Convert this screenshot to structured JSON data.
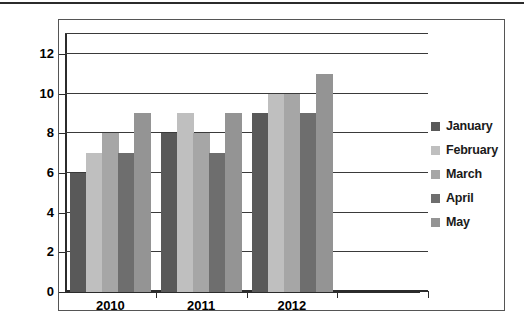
{
  "chart_data": {
    "type": "bar",
    "title": "",
    "xlabel": "",
    "ylabel": "",
    "categories": [
      "2010",
      "2011",
      "2012",
      ""
    ],
    "series": [
      {
        "name": "January",
        "color": "#595959",
        "values": [
          6,
          8,
          9,
          null
        ]
      },
      {
        "name": "February",
        "color": "#bfbfbf",
        "values": [
          7,
          9,
          10,
          null
        ]
      },
      {
        "name": "March",
        "color": "#a6a6a6",
        "values": [
          8,
          8,
          10,
          null
        ]
      },
      {
        "name": "April",
        "color": "#6e6e6e",
        "values": [
          7,
          7,
          9,
          null
        ]
      },
      {
        "name": "May",
        "color": "#949494",
        "values": [
          9,
          9,
          11,
          null
        ]
      }
    ],
    "ylim": [
      0,
      13
    ],
    "yticks": [
      0,
      2,
      4,
      6,
      8,
      10,
      12
    ],
    "ytick_labels": [
      "0",
      "2",
      "4",
      "6",
      "8",
      "10",
      "12"
    ],
    "gridlines": [
      0,
      2,
      4,
      6,
      8,
      10,
      12,
      13
    ],
    "grid": true,
    "legend_position": "right",
    "legend_entries": [
      "January",
      "February",
      "March",
      "April",
      "May"
    ]
  },
  "axis": {
    "y_labels": [
      "12",
      "10",
      "8",
      "6",
      "4",
      "2",
      "0"
    ],
    "x_labels": [
      "2010",
      "2011",
      "2012"
    ]
  },
  "colors": {
    "january": "#595959",
    "february": "#bfbfbf",
    "march": "#a6a6a6",
    "april": "#6e6e6e",
    "may": "#949494",
    "grid": "#3a3a3a",
    "axis": "#2b2b2b",
    "frame": "#555555",
    "background": "#ffffff"
  }
}
